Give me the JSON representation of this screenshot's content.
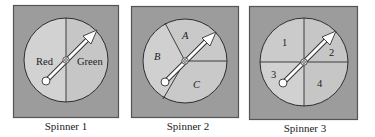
{
  "colors": {
    "box_fill": "#9c9c9c",
    "box_border": "#555555",
    "disc_fill": "#c9c9c9",
    "disc_fill_alt": "#d2d2d2",
    "line": "#2e2e2e",
    "arrow_fill": "#ffffff",
    "arrow_stroke": "#333333",
    "caption": "#222222"
  },
  "spinners": [
    {
      "caption": "Spinner 1",
      "sections": [
        {
          "label": "Red",
          "italic": false
        },
        {
          "label": "Green",
          "italic": false
        }
      ]
    },
    {
      "caption": "Spinner 2",
      "sections": [
        {
          "label": "A",
          "italic": true
        },
        {
          "label": "B",
          "italic": true
        },
        {
          "label": "C",
          "italic": true
        }
      ]
    },
    {
      "caption": "Spinner 3",
      "sections": [
        {
          "label": "1",
          "italic": false
        },
        {
          "label": "2",
          "italic": false
        },
        {
          "label": "3",
          "italic": false
        },
        {
          "label": "4",
          "italic": false
        }
      ]
    }
  ]
}
